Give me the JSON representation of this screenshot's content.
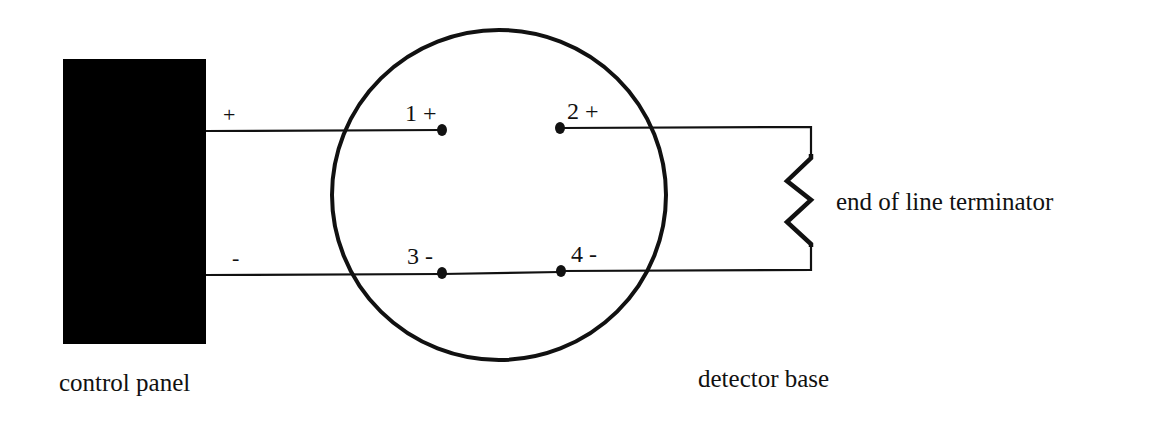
{
  "diagram": {
    "type": "wiring-diagram",
    "colors": {
      "background": "#ffffff",
      "ink": "#111111",
      "panel_fill": "#000000"
    },
    "control_panel": {
      "label": "control panel",
      "positive_label": "+",
      "negative_label": "-"
    },
    "detector_base": {
      "label": "detector base",
      "terminals": [
        {
          "id": 1,
          "label": "1 +"
        },
        {
          "id": 2,
          "label": "2 +"
        },
        {
          "id": 3,
          "label": "3 -"
        },
        {
          "id": 4,
          "label": "4 -"
        }
      ]
    },
    "end_of_line": {
      "label": "end of line terminator",
      "symbol": "resistor-zigzag"
    },
    "connections": [
      {
        "from": "control panel +",
        "to": "terminal 1 +"
      },
      {
        "from": "terminal 2 +",
        "to": "end of line terminator"
      },
      {
        "from": "control panel -",
        "to": "terminal 3 -"
      },
      {
        "from": "terminal 3 -",
        "to": "terminal 4 -"
      },
      {
        "from": "terminal 4 -",
        "to": "end of line terminator"
      }
    ]
  }
}
